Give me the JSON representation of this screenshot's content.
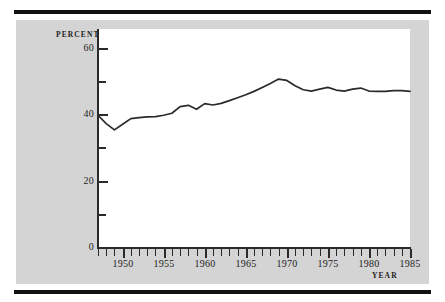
{
  "figure": {
    "percent_axis_title": "PERCENT",
    "year_axis_title": "YEAR"
  },
  "chart_data": {
    "type": "line",
    "title": "",
    "subtitle": "",
    "xlabel": "YEAR",
    "ylabel": "PERCENT",
    "xlim": [
      1947,
      1985
    ],
    "ylim": [
      0,
      66
    ],
    "grid": false,
    "legend": "none",
    "y_ticks_major": [
      0,
      20,
      40,
      60
    ],
    "y_ticks_minor": [
      10,
      30,
      50
    ],
    "x_ticks_major": [
      1950,
      1955,
      1960,
      1965,
      1970,
      1975,
      1980,
      1985
    ],
    "x_tick_interval": 1,
    "line_color": "#2b2b2b",
    "background_color": "#d4d4d4",
    "plot_background_color": "#ffffff",
    "x": [
      1947,
      1948,
      1949,
      1950,
      1951,
      1952,
      1953,
      1954,
      1955,
      1956,
      1957,
      1958,
      1959,
      1960,
      1961,
      1962,
      1963,
      1964,
      1965,
      1966,
      1967,
      1968,
      1969,
      1970,
      1971,
      1972,
      1973,
      1974,
      1975,
      1976,
      1977,
      1978,
      1979,
      1980,
      1981,
      1982,
      1983,
      1984,
      1985
    ],
    "values": [
      40.0,
      37.5,
      35.6,
      37.3,
      39.0,
      39.3,
      39.5,
      39.6,
      40.0,
      40.6,
      42.6,
      43.0,
      41.8,
      43.5,
      43.1,
      43.6,
      44.4,
      45.3,
      46.2,
      47.2,
      48.4,
      49.6,
      50.9,
      50.5,
      48.9,
      47.7,
      47.3,
      47.9,
      48.4,
      47.6,
      47.3,
      47.9,
      48.2,
      47.3,
      47.2,
      47.2,
      47.4,
      47.4,
      47.2
    ]
  },
  "ticks": {
    "y_labels": [
      "0",
      "20",
      "40",
      "60"
    ],
    "x_labels": [
      "1950",
      "1955",
      "1960",
      "1965",
      "1970",
      "1975",
      "1980",
      "1985"
    ]
  }
}
